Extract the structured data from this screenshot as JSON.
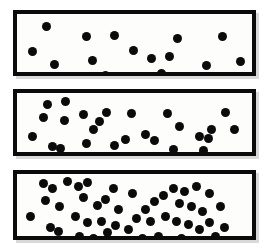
{
  "figure": {
    "title": "",
    "background_color": "#ffffff",
    "panel_fill_color": "#fdfdfb",
    "panel_border_color": "#0b0b0b",
    "dot_color": "#0b0b0b",
    "panel_border_width": 4,
    "dot_diameter": 9
  },
  "chart_data": {
    "type": "scatter",
    "title": "",
    "subtitle": "",
    "xlabel": "",
    "ylabel": "",
    "xlim": [
      0,
      240
    ],
    "ylim": [
      0,
      58
    ],
    "grid": false,
    "legend": null,
    "panel_count": 3,
    "panels": [
      {
        "name": "panel-low-density",
        "label": "",
        "frame": {
          "x": 13,
          "y": 10,
          "width": 243,
          "height": 66
        },
        "dot_count": 15,
        "relative_density": 1,
        "points": [
          {
            "x": 30,
            "y": 12
          },
          {
            "x": 71,
            "y": 22
          },
          {
            "x": 100,
            "y": 21
          },
          {
            "x": 16,
            "y": 37
          },
          {
            "x": 38,
            "y": 50
          },
          {
            "x": 77,
            "y": 46
          },
          {
            "x": 90,
            "y": 61
          },
          {
            "x": 137,
            "y": 44
          },
          {
            "x": 156,
            "y": 42
          },
          {
            "x": 164,
            "y": 24
          },
          {
            "x": 148,
            "y": 59
          },
          {
            "x": 210,
            "y": 22
          },
          {
            "x": 194,
            "y": 51
          },
          {
            "x": 228,
            "y": 47
          },
          {
            "x": 119,
            "y": 36
          }
        ]
      },
      {
        "name": "panel-medium-density",
        "label": "",
        "frame": {
          "x": 13,
          "y": 89,
          "width": 243,
          "height": 67
        },
        "dot_count": 34,
        "relative_density": 2,
        "points": [
          {
            "x": 31,
            "y": 11
          },
          {
            "x": 50,
            "y": 8
          },
          {
            "x": 27,
            "y": 24
          },
          {
            "x": 48,
            "y": 27
          },
          {
            "x": 16,
            "y": 43
          },
          {
            "x": 68,
            "y": 21
          },
          {
            "x": 84,
            "y": 28
          },
          {
            "x": 91,
            "y": 19
          },
          {
            "x": 78,
            "y": 36
          },
          {
            "x": 36,
            "y": 53
          },
          {
            "x": 44,
            "y": 55
          },
          {
            "x": 71,
            "y": 50
          },
          {
            "x": 62,
            "y": 64
          },
          {
            "x": 86,
            "y": 64
          },
          {
            "x": 100,
            "y": 52
          },
          {
            "x": 117,
            "y": 20
          },
          {
            "x": 111,
            "y": 46
          },
          {
            "x": 131,
            "y": 41
          },
          {
            "x": 140,
            "y": 47
          },
          {
            "x": 125,
            "y": 62
          },
          {
            "x": 146,
            "y": 64
          },
          {
            "x": 134,
            "y": 66
          },
          {
            "x": 154,
            "y": 20
          },
          {
            "x": 166,
            "y": 33
          },
          {
            "x": 160,
            "y": 56
          },
          {
            "x": 172,
            "y": 65
          },
          {
            "x": 186,
            "y": 43
          },
          {
            "x": 196,
            "y": 45
          },
          {
            "x": 190,
            "y": 57
          },
          {
            "x": 192,
            "y": 66
          },
          {
            "x": 213,
            "y": 19
          },
          {
            "x": 199,
            "y": 36
          },
          {
            "x": 222,
            "y": 36
          },
          {
            "x": 205,
            "y": 62
          }
        ]
      },
      {
        "name": "panel-high-density",
        "label": "",
        "frame": {
          "x": 13,
          "y": 170,
          "width": 243,
          "height": 70
        },
        "dot_count": 58,
        "relative_density": 4,
        "points": [
          {
            "x": 27,
            "y": 9
          },
          {
            "x": 36,
            "y": 14
          },
          {
            "x": 52,
            "y": 7
          },
          {
            "x": 29,
            "y": 25
          },
          {
            "x": 43,
            "y": 30
          },
          {
            "x": 14,
            "y": 40
          },
          {
            "x": 34,
            "y": 50
          },
          {
            "x": 42,
            "y": 54
          },
          {
            "x": 27,
            "y": 62
          },
          {
            "x": 24,
            "y": 72
          },
          {
            "x": 63,
            "y": 12
          },
          {
            "x": 72,
            "y": 8
          },
          {
            "x": 68,
            "y": 22
          },
          {
            "x": 82,
            "y": 29
          },
          {
            "x": 90,
            "y": 24
          },
          {
            "x": 60,
            "y": 40
          },
          {
            "x": 72,
            "y": 45
          },
          {
            "x": 86,
            "y": 44
          },
          {
            "x": 64,
            "y": 58
          },
          {
            "x": 78,
            "y": 60
          },
          {
            "x": 92,
            "y": 55
          },
          {
            "x": 99,
            "y": 14
          },
          {
            "x": 104,
            "y": 33
          },
          {
            "x": 101,
            "y": 48
          },
          {
            "x": 58,
            "y": 70
          },
          {
            "x": 88,
            "y": 70
          },
          {
            "x": 118,
            "y": 18
          },
          {
            "x": 122,
            "y": 42
          },
          {
            "x": 114,
            "y": 52
          },
          {
            "x": 131,
            "y": 33
          },
          {
            "x": 140,
            "y": 26
          },
          {
            "x": 136,
            "y": 44
          },
          {
            "x": 128,
            "y": 60
          },
          {
            "x": 144,
            "y": 58
          },
          {
            "x": 150,
            "y": 20
          },
          {
            "x": 152,
            "y": 40
          },
          {
            "x": 147,
            "y": 70
          },
          {
            "x": 160,
            "y": 14
          },
          {
            "x": 171,
            "y": 16
          },
          {
            "x": 183,
            "y": 12
          },
          {
            "x": 197,
            "y": 18
          },
          {
            "x": 166,
            "y": 28
          },
          {
            "x": 178,
            "y": 30
          },
          {
            "x": 189,
            "y": 35
          },
          {
            "x": 163,
            "y": 44
          },
          {
            "x": 175,
            "y": 47
          },
          {
            "x": 186,
            "y": 52
          },
          {
            "x": 197,
            "y": 45
          },
          {
            "x": 168,
            "y": 60
          },
          {
            "x": 180,
            "y": 64
          },
          {
            "x": 193,
            "y": 62
          },
          {
            "x": 172,
            "y": 70
          },
          {
            "x": 188,
            "y": 70
          },
          {
            "x": 208,
            "y": 30
          },
          {
            "x": 212,
            "y": 50
          },
          {
            "x": 203,
            "y": 58
          },
          {
            "x": 216,
            "y": 66
          },
          {
            "x": 205,
            "y": 70
          }
        ]
      }
    ]
  }
}
